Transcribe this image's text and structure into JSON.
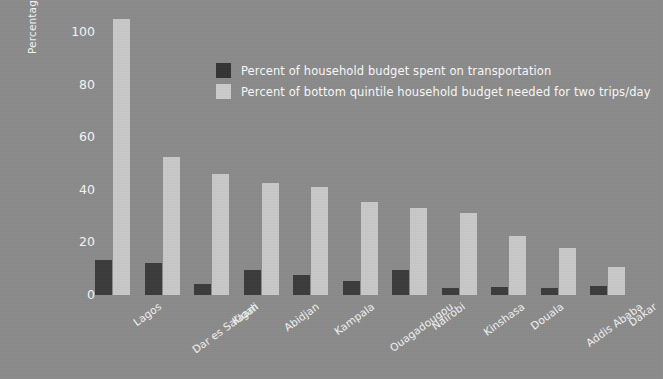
{
  "chart_data": {
    "type": "bar",
    "title": "",
    "subtitle": "",
    "xlabel": "",
    "ylabel": "Percentage of household budget",
    "ylim": [
      0,
      110
    ],
    "yticks": [
      0,
      20,
      40,
      60,
      80,
      100
    ],
    "grid": false,
    "legend_position": "inside-top-center",
    "categories": [
      "Lagos",
      "Dar es Salaam",
      "Kigali",
      "Abidjan",
      "Kampala",
      "Ouagadougou",
      "Nairobi",
      "Kinshasa",
      "Douala",
      "Addis Ababa",
      "Dakar"
    ],
    "series": [
      {
        "name": "Percent of household budget spent on transportation",
        "color": "#3b3b3b",
        "values": [
          13.5,
          12,
          4,
          9.5,
          7.5,
          5.5,
          9.5,
          2.5,
          3,
          2.5,
          3.5
        ]
      },
      {
        "name": "Percent of bottom quintile household budget needed for two trips/day",
        "color": "#c9c9c9",
        "values": [
          105,
          52.5,
          46,
          42.5,
          41,
          35.5,
          33,
          31,
          22.5,
          18,
          10.5
        ]
      }
    ]
  },
  "axis": {
    "y_title": "Percentage of household budget",
    "y_ticks": [
      "100",
      "80",
      "60",
      "40",
      "20",
      "0"
    ]
  },
  "legend": {
    "items": [
      {
        "label": "Percent of household budget spent on transportation",
        "swatch": "dark-swatch"
      },
      {
        "label": "Percent of bottom quintile household budget needed for two trips/day",
        "swatch": "light-swatch"
      }
    ]
  },
  "colors": {
    "background": "#8b8b8b",
    "series_dark": "#3b3b3b",
    "series_light": "#c9c9c9",
    "text": "#f4f4f4"
  }
}
